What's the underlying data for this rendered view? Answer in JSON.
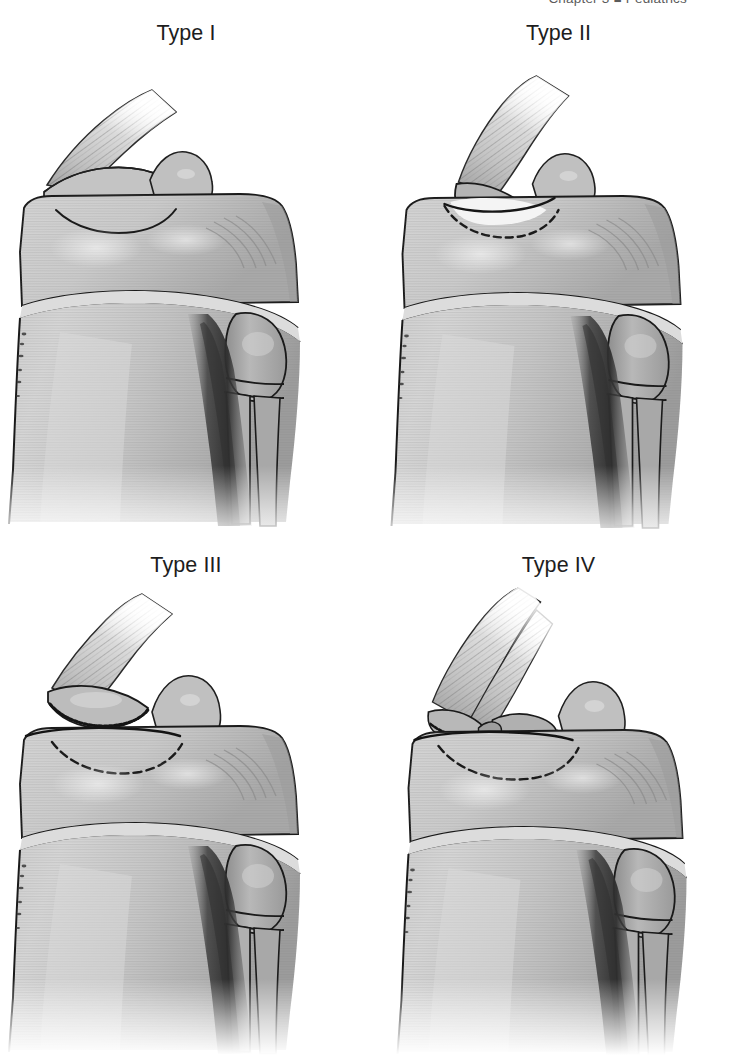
{
  "header": {
    "running_head": "Chapter 3  ■  Pediatrics"
  },
  "figure": {
    "caption": "",
    "panels": [
      {
        "id": "type-1",
        "label": "Type I",
        "description": "Proximal tibia, anterolateral view. Small tibial tubercle fragment avulsed across the secondary ossification center distal to the level of the proximal tibial physis; fragment remains essentially undisplaced with the patellar tendon attached.",
        "fracture_line": "solid",
        "fragment_displacement": "minimal",
        "comminution": "none"
      },
      {
        "id": "type-2",
        "label": "Type II",
        "description": "Fracture line courses proximally to the junction of the tubercle ossification center and the proximal tibial epiphysis; the tubercle fragment is hinged and elevated anteriorly by the patellar tendon.",
        "fracture_line": "dashed",
        "fragment_displacement": "moderate",
        "comminution": "none"
      },
      {
        "id": "type-3",
        "label": "Type III",
        "description": "Fracture propagates posteriorly across the epiphysis and exits into the knee joint (intra-articular); the tubercle fragment is markedly displaced proximally by the patellar tendon.",
        "fracture_line": "dashed",
        "fragment_displacement": "marked",
        "comminution": "none"
      },
      {
        "id": "type-4",
        "label": "Type IV",
        "description": "Comminuted pattern — the avulsed tubercle fragment is broken into multiple pieces, with fracture extension through the entire proximal tibial physis.",
        "fracture_line": "dashed",
        "fragment_displacement": "marked",
        "comminution": "present"
      }
    ],
    "anatomy_labels": [
      "patellar tendon",
      "tibial tubercle fragment",
      "proximal tibial epiphysis",
      "proximal tibial physis",
      "tibial metaphysis / shaft",
      "fibular head",
      "fibular shaft"
    ]
  },
  "style": {
    "background": "#ffffff",
    "bone_light": "#d3d3d3",
    "bone_mid": "#bdbdbd",
    "bone_dark": "#8f8f8f",
    "shadow_dark": "#3c3c3c",
    "outline": "#1a1a1a",
    "label_color": "#1d1d1d",
    "header_color": "#5b5b5b"
  }
}
